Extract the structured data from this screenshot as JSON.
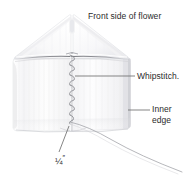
{
  "diagram": {
    "title": "Front side of flower",
    "background_color": "#ffffff",
    "text_color": "#2b2b2b",
    "leader_line_color": "#6f6f6f",
    "fabric_color": "#fbfbfc",
    "fabric_shade_color": "#e3e4e7",
    "fold_line_color": "#9a9ba0",
    "thread_color": "#8e8f95",
    "labels": {
      "title": "Front side of flower",
      "whipstitch": "Whipstitch.",
      "inner_edge_line1": "Inner",
      "inner_edge_line2": "edge",
      "measurement": "¼",
      "measurement_unit": "″"
    },
    "parts": {
      "flower_body": "folded-fabric-flower",
      "top_fold": "triangular-top-fold",
      "apex_notch": "center-apex-notch",
      "horizontal_fold": "horizontal-fold-crease",
      "center_seam": "center-whipstitch-seam",
      "thread_tail": "trailing-needle-thread",
      "inner_edge": "right-inner-edge"
    }
  }
}
